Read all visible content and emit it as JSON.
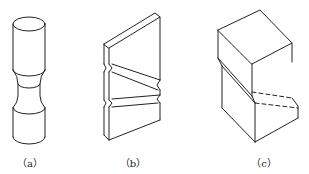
{
  "figure": {
    "panels": [
      {
        "id": "a",
        "label": "（a）",
        "shape": "cylindrical specimen with reduced neck"
      },
      {
        "id": "b",
        "label": "（b）",
        "shape": "flat plate with two V-notched grooves"
      },
      {
        "id": "c",
        "label": "（c）",
        "shape": "rectangular block with inclined shear notch"
      }
    ],
    "colors": {
      "line": "#222222",
      "background": "#ffffff"
    }
  }
}
